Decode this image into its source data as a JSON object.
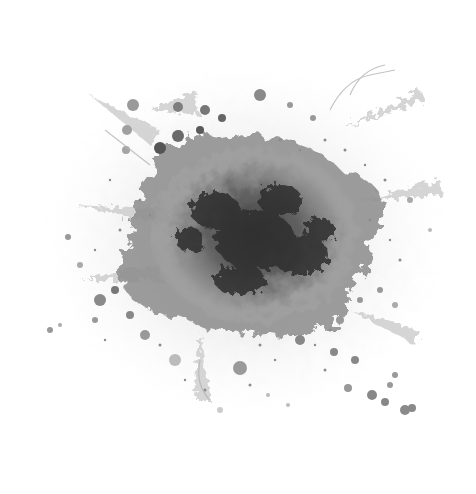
{
  "image": {
    "description": "Grayscale ink paint splatter explosion on white background",
    "background_color": "#ffffff",
    "palette": [
      "#2a2a2a",
      "#4a4a4a",
      "#6e6e6e",
      "#8f8f8f",
      "#b0b0b0",
      "#d2d2d2"
    ],
    "center": [
      250,
      245
    ]
  }
}
